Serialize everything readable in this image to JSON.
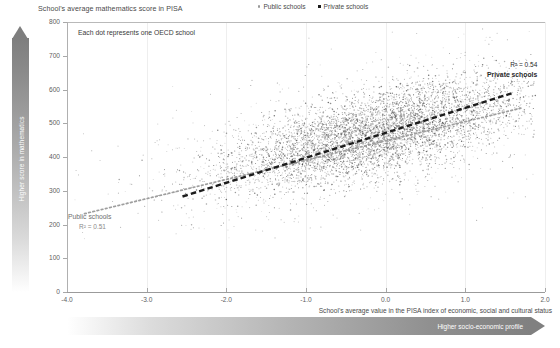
{
  "chart_data": {
    "type": "scatter",
    "title": "School's average mathematics score in PISA",
    "note": "Each dot represents one OECD school",
    "xlabel": "School's average value in the PISA index of economic, social and cultural status",
    "ylabel": "School's average mathematics score in PISA",
    "xlim": [
      -4.0,
      2.0
    ],
    "ylim": [
      0,
      800
    ],
    "grid": "vertical",
    "legend_position": "top-center",
    "xticks": [
      "-4.0",
      "-3.0",
      "-2.0",
      "-1.0",
      "0.0",
      "1.0",
      "2.0"
    ],
    "xtick_values": [
      -4.0,
      -3.0,
      -2.0,
      -1.0,
      0.0,
      1.0,
      2.0
    ],
    "yticks": [
      "0",
      "100",
      "200",
      "300",
      "400",
      "500",
      "600",
      "700",
      "800"
    ],
    "ytick_values": [
      0,
      100,
      200,
      300,
      400,
      500,
      600,
      700,
      800
    ],
    "series": [
      {
        "name": "Public schools",
        "marker": "dot",
        "color": "#9a9a9a",
        "r2_label": "R² = 0.51",
        "r2": 0.51,
        "trendline": {
          "style": "dotted",
          "color": "#9e9e9e",
          "x_start": -3.78,
          "y_start": 232,
          "x_end": 1.72,
          "y_end": 546
        }
      },
      {
        "name": "Private schools",
        "marker": "square",
        "color": "#1c1c1c",
        "r2_label": "R² = 0.54",
        "r2": 0.54,
        "trendline": {
          "style": "dashed",
          "color": "#1c1c1c",
          "x_start": -2.55,
          "y_start": 283,
          "x_end": 1.6,
          "y_end": 590
        }
      }
    ],
    "cloud": {
      "description": "Dense gray point cloud of OECD schools rising from lower-left to upper-right",
      "x_center": -0.15,
      "y_center": 468,
      "x_spread": 0.95,
      "y_spread": 62,
      "slope": 57,
      "n_points": 5200
    },
    "annotations": [
      {
        "text": "R² = 0.54",
        "x": 1.6,
        "y": 620
      },
      {
        "text": "Private schools",
        "x": 1.6,
        "y": 600
      },
      {
        "text": "Public schools",
        "x": -3.75,
        "y": 200
      },
      {
        "text": "R² = 0.51",
        "x": -3.6,
        "y": 180
      }
    ]
  },
  "axes": {
    "y_arrow_label": "Higher score in mathematics",
    "x_arrow_label": "Higher socio-economic profile"
  },
  "legend": {
    "items": [
      {
        "label": "Public schools"
      },
      {
        "label": "Private schools"
      }
    ]
  }
}
